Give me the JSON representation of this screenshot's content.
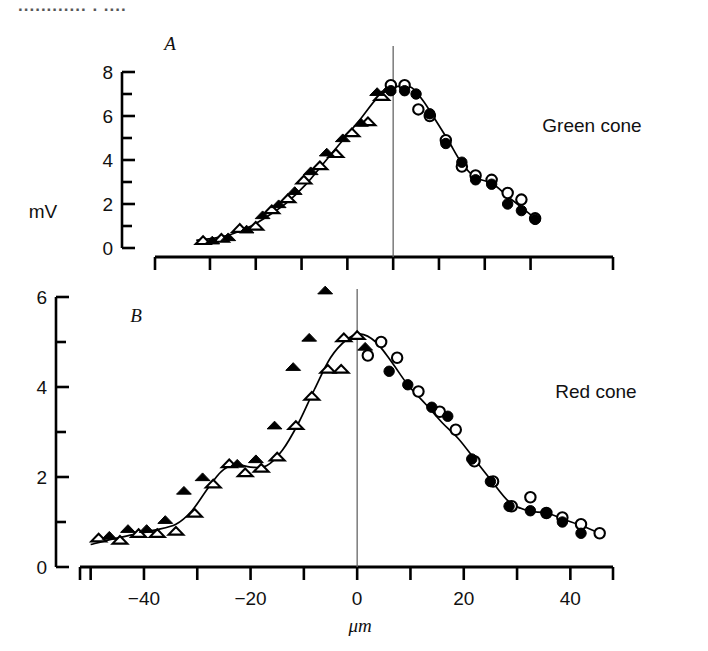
{
  "figure": {
    "top_cropped_text": "............ . ....",
    "y_axis_label": "mV",
    "x_axis_label": "μm"
  },
  "panels": [
    {
      "id": "A",
      "cone_label": "Green cone",
      "y_tick_labels": [
        "0",
        "2",
        "4",
        "6",
        "8"
      ],
      "x_tick_labels": [
        "",
        "",
        "",
        "",
        "",
        "",
        ""
      ]
    },
    {
      "id": "B",
      "cone_label": "Red cone",
      "y_tick_labels": [
        "0",
        "2",
        "4",
        "6"
      ],
      "x_tick_labels": [
        "-40",
        "-20",
        "0",
        "20",
        "40"
      ]
    }
  ],
  "chart_data": [
    {
      "type": "scatter",
      "panel": "A",
      "title": "Green cone",
      "xlabel": "μm",
      "ylabel": "mV",
      "xlim": [
        -52,
        48
      ],
      "ylim": [
        0,
        8
      ],
      "x_ticks": [
        -40,
        -30,
        -20,
        -10,
        0,
        10,
        20,
        30
      ],
      "x_tick_labels": [
        "-40",
        "",
        "-20",
        "",
        "0",
        "",
        "20",
        ""
      ],
      "y_ticks": [
        0,
        1,
        2,
        3,
        4,
        5,
        6,
        7,
        8
      ],
      "y_tick_labels": [
        "0",
        "",
        "2",
        "",
        "4",
        "",
        "6",
        "",
        "8"
      ],
      "grid": false,
      "reference_line_x": 0,
      "series": [
        {
          "name": "open-triangle",
          "marker": "open-triangle",
          "points": [
            [
              -41.5,
              0.35
            ],
            [
              -37.5,
              0.45
            ],
            [
              -33.5,
              0.9
            ],
            [
              -30.0,
              1.0
            ],
            [
              -26.5,
              1.75
            ],
            [
              -23.0,
              2.25
            ],
            [
              -19.5,
              3.1
            ],
            [
              -16.0,
              3.75
            ],
            [
              -12.5,
              4.3
            ],
            [
              -9.0,
              5.25
            ],
            [
              -5.5,
              5.75
            ],
            [
              -2.5,
              6.9
            ]
          ]
        },
        {
          "name": "filled-triangle",
          "marker": "filled-triangle",
          "points": [
            [
              -39.5,
              0.35
            ],
            [
              -36.0,
              0.5
            ],
            [
              -32.0,
              0.85
            ],
            [
              -28.5,
              1.5
            ],
            [
              -25.0,
              2.0
            ],
            [
              -21.5,
              2.6
            ],
            [
              -18.0,
              3.5
            ],
            [
              -14.5,
              4.35
            ],
            [
              -11.0,
              5.0
            ],
            [
              -7.0,
              5.7
            ],
            [
              -3.5,
              7.1
            ],
            [
              -1.0,
              7.25
            ]
          ]
        },
        {
          "name": "open-circle",
          "marker": "open-circle",
          "points": [
            [
              -0.5,
              7.4
            ],
            [
              2.5,
              7.4
            ],
            [
              5.5,
              6.3
            ],
            [
              8.0,
              6.0
            ],
            [
              11.5,
              4.9
            ],
            [
              15.0,
              3.7
            ],
            [
              18.0,
              3.3
            ],
            [
              21.5,
              3.1
            ],
            [
              25.0,
              2.5
            ],
            [
              28.0,
              2.2
            ],
            [
              31.0,
              1.35
            ]
          ]
        },
        {
          "name": "filled-circle",
          "marker": "filled-circle",
          "points": [
            [
              -0.5,
              7.15
            ],
            [
              2.5,
              7.15
            ],
            [
              5.0,
              7.0
            ],
            [
              8.0,
              6.1
            ],
            [
              11.5,
              4.75
            ],
            [
              15.0,
              3.9
            ],
            [
              18.0,
              3.1
            ],
            [
              21.5,
              2.9
            ],
            [
              25.0,
              2.0
            ],
            [
              28.0,
              1.7
            ],
            [
              31.0,
              1.3
            ]
          ]
        }
      ],
      "fit_curve": [
        [
          -43,
          0.35
        ],
        [
          -39,
          0.45
        ],
        [
          -35,
          0.65
        ],
        [
          -31,
          1.0
        ],
        [
          -27,
          1.5
        ],
        [
          -23,
          2.1
        ],
        [
          -19,
          2.9
        ],
        [
          -15,
          3.9
        ],
        [
          -11,
          4.9
        ],
        [
          -7,
          5.9
        ],
        [
          -4,
          6.7
        ],
        [
          -1.5,
          7.15
        ],
        [
          1.0,
          7.35
        ],
        [
          4.0,
          7.3
        ],
        [
          6.5,
          6.7
        ],
        [
          9.0,
          5.9
        ],
        [
          12.0,
          4.9
        ],
        [
          15.0,
          3.85
        ],
        [
          18.0,
          3.2
        ],
        [
          21.5,
          2.95
        ],
        [
          25.0,
          2.35
        ],
        [
          28.0,
          1.85
        ],
        [
          31.0,
          1.35
        ]
      ]
    },
    {
      "type": "scatter",
      "panel": "B",
      "title": "Red cone",
      "xlabel": "μm",
      "ylabel": "mV",
      "xlim": [
        -52,
        48
      ],
      "ylim": [
        0,
        6
      ],
      "x_ticks": [
        -50,
        -40,
        -30,
        -20,
        -10,
        0,
        10,
        20,
        30,
        40
      ],
      "x_tick_labels": [
        "",
        "-40",
        "",
        "-20",
        "",
        "0",
        "",
        "20",
        "",
        "40"
      ],
      "y_ticks": [
        0,
        1,
        2,
        3,
        4,
        5,
        6
      ],
      "y_tick_labels": [
        "0",
        "",
        "2",
        "",
        "4",
        "",
        "6"
      ],
      "grid": false,
      "reference_line_x": 0,
      "series": [
        {
          "name": "open-triangle",
          "marker": "open-triangle",
          "points": [
            [
              -48.5,
              0.65
            ],
            [
              -44.5,
              0.6
            ],
            [
              -41.0,
              0.75
            ],
            [
              -37.5,
              0.75
            ],
            [
              -34.0,
              0.8
            ],
            [
              -30.5,
              1.2
            ],
            [
              -27.0,
              1.85
            ],
            [
              -24.0,
              2.3
            ],
            [
              -21.0,
              2.1
            ],
            [
              -18.0,
              2.2
            ],
            [
              -15.0,
              2.45
            ],
            [
              -11.5,
              3.15
            ],
            [
              -8.5,
              3.8
            ],
            [
              -5.5,
              4.4
            ],
            [
              -2.5,
              5.1
            ],
            [
              0.0,
              5.15
            ],
            [
              -3.0,
              4.4
            ]
          ]
        },
        {
          "name": "filled-triangle",
          "marker": "filled-triangle",
          "points": [
            [
              -46.5,
              0.7
            ],
            [
              -43.0,
              0.85
            ],
            [
              -39.5,
              0.85
            ],
            [
              -36.0,
              1.05
            ],
            [
              -32.5,
              1.7
            ],
            [
              -29.0,
              2.0
            ],
            [
              -22.5,
              2.3
            ],
            [
              -19.0,
              2.4
            ],
            [
              -15.5,
              3.15
            ],
            [
              -12.0,
              4.45
            ],
            [
              -9.0,
              5.1
            ],
            [
              -6.0,
              6.15
            ],
            [
              1.5,
              4.9
            ]
          ]
        },
        {
          "name": "open-circle",
          "marker": "open-circle",
          "points": [
            [
              2.0,
              4.7
            ],
            [
              4.5,
              5.0
            ],
            [
              7.5,
              4.65
            ],
            [
              11.5,
              3.9
            ],
            [
              15.5,
              3.45
            ],
            [
              18.5,
              3.05
            ],
            [
              22.0,
              2.35
            ],
            [
              25.5,
              1.9
            ],
            [
              29.0,
              1.35
            ],
            [
              32.5,
              1.55
            ],
            [
              35.5,
              1.2
            ],
            [
              38.5,
              1.1
            ],
            [
              42.0,
              0.95
            ],
            [
              45.5,
              0.75
            ]
          ]
        },
        {
          "name": "filled-circle",
          "marker": "filled-circle",
          "points": [
            [
              6.0,
              4.35
            ],
            [
              9.5,
              4.05
            ],
            [
              14.0,
              3.55
            ],
            [
              17.0,
              3.35
            ],
            [
              21.5,
              2.4
            ],
            [
              25.0,
              1.9
            ],
            [
              28.5,
              1.35
            ],
            [
              32.5,
              1.25
            ],
            [
              35.5,
              1.2
            ],
            [
              38.5,
              1.0
            ],
            [
              42.0,
              0.75
            ]
          ]
        }
      ],
      "fit_curve": [
        [
          -50,
          0.5
        ],
        [
          -46,
          0.62
        ],
        [
          -42,
          0.72
        ],
        [
          -38,
          0.82
        ],
        [
          -34,
          0.95
        ],
        [
          -31,
          1.25
        ],
        [
          -28,
          1.75
        ],
        [
          -25.5,
          2.12
        ],
        [
          -23,
          2.28
        ],
        [
          -20,
          2.22
        ],
        [
          -17,
          2.25
        ],
        [
          -14,
          2.6
        ],
        [
          -11,
          3.2
        ],
        [
          -8,
          3.95
        ],
        [
          -5,
          4.65
        ],
        [
          -2,
          5.05
        ],
        [
          0.5,
          5.18
        ],
        [
          3.5,
          5.0
        ],
        [
          6.5,
          4.55
        ],
        [
          9.5,
          4.05
        ],
        [
          13,
          3.6
        ],
        [
          16,
          3.2
        ],
        [
          19,
          2.85
        ],
        [
          22,
          2.4
        ],
        [
          25,
          1.95
        ],
        [
          28.5,
          1.45
        ],
        [
          32,
          1.25
        ],
        [
          35.5,
          1.2
        ],
        [
          39,
          1.05
        ],
        [
          42.5,
          0.9
        ],
        [
          46,
          0.72
        ]
      ]
    }
  ]
}
